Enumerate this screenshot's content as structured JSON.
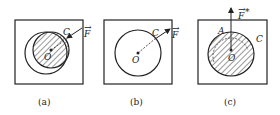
{
  "panels": [
    {
      "caption": "(a)",
      "center_label": "O",
      "point_label": "C",
      "force_label": "F",
      "force_marker": "→"
    },
    {
      "caption": "(b)",
      "center_label": "O",
      "point_label": "C",
      "force_label": "F",
      "force_marker": "→"
    },
    {
      "caption": "(c)",
      "center_label": "O",
      "point_label": "A",
      "region_label": "C",
      "force_label": "F",
      "force_marker": "→",
      "force_suffix": "*"
    }
  ]
}
